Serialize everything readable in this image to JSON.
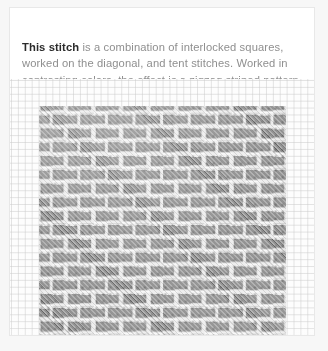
{
  "card": {
    "caption": {
      "lead": "This stitch",
      "rest": " is a combination of interlocked squares, worked on the diagonal, and tent stitches. Worked in contrasting colors, the effect is a zigzag striped pattern."
    },
    "image": {
      "alt": "Needlepoint canvas worked with interlocked squares and tent stitches in two contrasting gray threads forming a zigzag striped pattern",
      "ground_thread_color": "#9b9b9b",
      "light_thread_color": "#f0f0f0",
      "canvas_color": "#fdfdfd",
      "canvas_mesh_line_color": "#cdcdcd"
    }
  },
  "theme": {
    "page_background": "#f7f7f7",
    "card_background": "#ffffff",
    "card_border": "#e8e8e8",
    "text_color": "#8f8f8f",
    "lead_text_color": "#2b2b2b"
  }
}
